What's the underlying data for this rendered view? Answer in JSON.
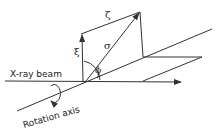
{
  "diagram": {
    "labels": {
      "beam": "X-ray beam",
      "axis": "Rotation axis",
      "zeta": "ζ",
      "xi": "ξ",
      "sigma": "σ",
      "phi": "ϕ"
    },
    "colors": {
      "line": "#333333",
      "text": "#222222",
      "background": "#ffffff"
    }
  }
}
